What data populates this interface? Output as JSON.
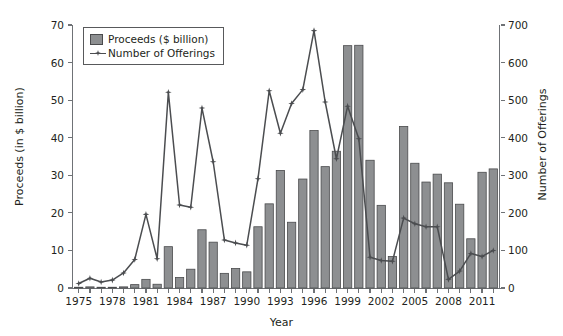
{
  "figure": {
    "background": "#ffffff",
    "bar_color": "#8d8f91",
    "bar_edge_color": "#4a4b4d",
    "line_color": "#4b4d50",
    "axis_color": "#6f7276",
    "text_color": "#231f20"
  },
  "legend": {
    "position": "top-left",
    "entries": [
      {
        "label": "Proceeds ($ billion)",
        "marker": "bar-swatch"
      },
      {
        "label": "Number of Offerings",
        "marker": "line-with-star-marker"
      }
    ]
  },
  "axes": {
    "x": {
      "label": "Year",
      "ticks": [
        1975,
        1978,
        1981,
        1984,
        1987,
        1990,
        1993,
        1996,
        1999,
        2002,
        2005,
        2008,
        2011
      ],
      "min": 1974.4,
      "max": 2012.6
    },
    "y_left": {
      "label": "Proceeds (in $ billion)",
      "ticks": [
        0,
        10,
        20,
        30,
        40,
        50,
        60,
        70
      ],
      "min": 0,
      "max": 70
    },
    "y_right": {
      "label": "Number of Offerings",
      "ticks": [
        0,
        100,
        200,
        300,
        400,
        500,
        600,
        700
      ],
      "min": 0,
      "max": 700
    }
  },
  "chart_data": {
    "type": "bar",
    "title": "",
    "subtitle": "",
    "xlabel": "Year",
    "ylabel": "Proceeds (in $ billion)",
    "ylabel_secondary": "Number of Offerings",
    "xlim": [
      1974.4,
      2012.6
    ],
    "ylim": [
      0,
      70
    ],
    "ylim_secondary": [
      0,
      700
    ],
    "grid": false,
    "legend_position": "top-left",
    "categories": [
      1975,
      1976,
      1977,
      1978,
      1979,
      1980,
      1981,
      1982,
      1983,
      1984,
      1985,
      1986,
      1987,
      1988,
      1989,
      1990,
      1991,
      1992,
      1993,
      1994,
      1995,
      1996,
      1997,
      1998,
      1999,
      2000,
      2001,
      2002,
      2003,
      2004,
      2005,
      2006,
      2007,
      2008,
      2009,
      2010,
      2011,
      2012
    ],
    "series": [
      {
        "name": "Proceeds ($ billion)",
        "type": "bar",
        "axis": "left",
        "unit": "$ billion",
        "values": [
          0.2,
          0.3,
          0.2,
          0.2,
          0.3,
          0.9,
          2.3,
          1.0,
          11.0,
          2.8,
          5.0,
          15.5,
          12.2,
          3.9,
          5.2,
          4.3,
          16.3,
          22.4,
          31.3,
          17.5,
          29.0,
          41.9,
          32.3,
          36.4,
          64.5,
          64.6,
          34.0,
          22.0,
          8.4,
          43.0,
          33.2,
          28.2,
          30.3,
          28.0,
          22.3,
          13.1,
          30.8,
          31.7
        ]
      },
      {
        "name": "Number of Offerings",
        "type": "line",
        "axis": "right",
        "unit": "offerings",
        "values": [
          12,
          26,
          16,
          21,
          40,
          76,
          196,
          78,
          521,
          221,
          215,
          479,
          336,
          128,
          120,
          114,
          291,
          525,
          412,
          491,
          528,
          685,
          495,
          344,
          484,
          397,
          82,
          73,
          71,
          186,
          171,
          163,
          163,
          23,
          45,
          92,
          84,
          100
        ]
      }
    ]
  }
}
